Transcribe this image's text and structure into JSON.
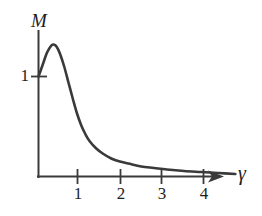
{
  "figure": {
    "background_color": "#ffffff",
    "ink_color": "#3a3a3a",
    "text_color": "#1d1d1d"
  },
  "axes": {
    "y_title": "M",
    "x_title": "γ",
    "y_ticks": [
      {
        "label": "1",
        "value": 1
      }
    ],
    "x_ticks": [
      {
        "label": "1",
        "value": 1
      },
      {
        "label": "2",
        "value": 2
      },
      {
        "label": "3",
        "value": 3
      },
      {
        "label": "4",
        "value": 4
      }
    ]
  },
  "chart_data": {
    "type": "line",
    "title": "",
    "subtitle": "",
    "xlabel": "γ",
    "ylabel": "M",
    "xlim": [
      0,
      4.8
    ],
    "ylim": [
      0,
      1.75
    ],
    "grid": false,
    "legend": null,
    "annotations": [],
    "series": [
      {
        "name": "magnification factor",
        "x": [
          0.0,
          0.1,
          0.2,
          0.3,
          0.35,
          0.42,
          0.5,
          0.6,
          0.7,
          0.8,
          0.9,
          1.0,
          1.1,
          1.2,
          1.35,
          1.5,
          1.7,
          1.9,
          2.1,
          2.4,
          2.7,
          3.0,
          3.4,
          3.8,
          4.2,
          4.6
        ],
        "y": [
          1.0,
          1.12,
          1.24,
          1.31,
          1.32,
          1.3,
          1.23,
          1.1,
          0.94,
          0.78,
          0.63,
          0.51,
          0.42,
          0.35,
          0.28,
          0.23,
          0.18,
          0.15,
          0.13,
          0.1,
          0.085,
          0.07,
          0.055,
          0.045,
          0.035,
          0.025
        ]
      }
    ]
  }
}
